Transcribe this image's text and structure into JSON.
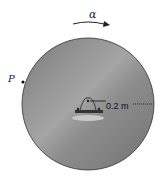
{
  "diagram": {
    "rotation_label": "α",
    "point_label": "P",
    "radius_label": "0.2 m",
    "disc": {
      "cx": 88,
      "cy": 104,
      "r": 66,
      "fill": "#8a8a8a"
    },
    "colors": {
      "ink": "#222222",
      "disc_dark": "#6f6f6f",
      "disc_light": "#a8a8a8"
    }
  }
}
